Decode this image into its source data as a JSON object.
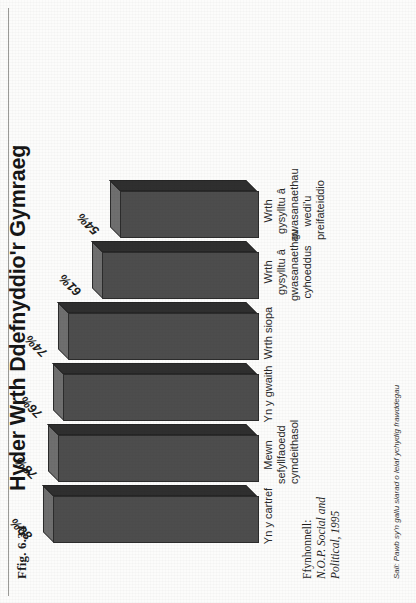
{
  "figure": {
    "number_label": "Ffig. 6.34",
    "title": "Hyder Wrth Ddefnyddio'r Gymraeg",
    "source_lead": "Ffynhonnell:",
    "source_line1": "N.O.P. Social and",
    "source_line2": "Political, 1995",
    "basis_note": "Sail: Pawb sy'n gallu siarad o leiaf ychydig frawddegau"
  },
  "chart_data": {
    "type": "bar",
    "title": "Hyder Wrth Ddefnyddio'r Gymraeg",
    "xlabel": "",
    "ylabel": "",
    "ylim": [
      0,
      100
    ],
    "grid": false,
    "legend": "none",
    "value_suffix": "%",
    "categories": [
      "Yn y cartref",
      "Mewn sefyllfaoedd cymdeithasol",
      "Yn y gwaith",
      "Wrth siopa",
      "Wrth gysylltu â gwasanaethau cyhoeddus",
      "Wrth gysylltu â gwasanaethau wedi'u preifateiddio"
    ],
    "category_lines": [
      [
        "Yn y cartref"
      ],
      [
        "Mewn sefyllfaoedd",
        "cymdeithasol"
      ],
      [
        "Yn y gwaith"
      ],
      [
        "Wrth siopa"
      ],
      [
        "Wrth gysylltu â",
        "gwasanaethau",
        "cyhoeddus"
      ],
      [
        "Wrth gysylltu â",
        "gwasanaethau wedi'u",
        "preifateiddio"
      ]
    ],
    "values": [
      80,
      78,
      76,
      74,
      61,
      54
    ],
    "value_labels": [
      "80%",
      "78%",
      "76%",
      "74%",
      "61%",
      "54%"
    ],
    "bar_color": "#4d4d4d",
    "bar_top_color": "#6f6f6f",
    "bar_side_color": "#2f2f2f"
  }
}
